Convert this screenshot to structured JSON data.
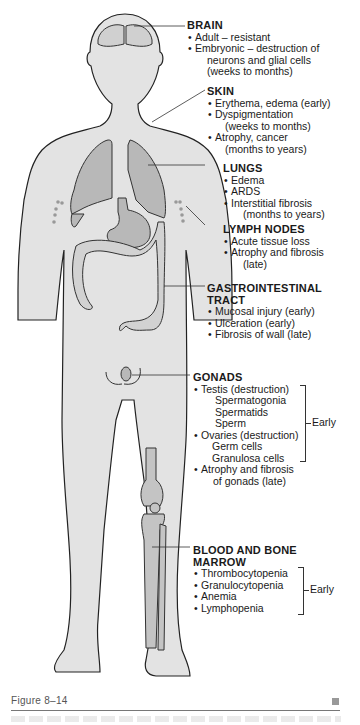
{
  "figure": {
    "caption": "Figure 8–14",
    "colors": {
      "body_fill": "#e3e3e3",
      "organ_fill": "#b8b8b8",
      "outline": "#222222",
      "caption_rule": "#777777"
    }
  },
  "labels": {
    "brain": {
      "title": "BRAIN",
      "items": [
        "Adult – resistant",
        "Embryonic – destruction of"
      ],
      "continuation": [
        "neurons and glial cells",
        "(weeks to months)"
      ]
    },
    "skin": {
      "title": "SKIN",
      "items": [
        "Erythema, edema (early)",
        "Dyspigmentation",
        "Atrophy, cancer"
      ],
      "dyspig_cont": "(weeks to months)",
      "atrophy_cont": "(months to years)"
    },
    "lungs": {
      "title": "LUNGS",
      "items": [
        "Edema",
        "ARDS",
        "Interstitial fibrosis"
      ],
      "fibrosis_cont": "(months to years)"
    },
    "lymph_nodes": {
      "title": "LYMPH NODES",
      "items": [
        "Acute tissue loss",
        "Atrophy and fibrosis"
      ],
      "atrophy_cont": "(late)"
    },
    "gi_tract": {
      "title_line1": "GASTROINTESTINAL",
      "title_line2": "TRACT",
      "items": [
        "Mucosal injury (early)",
        "Ulceration (early)",
        "Fibrosis of wall (late)"
      ]
    },
    "gonads": {
      "title": "GONADS",
      "testis": "Testis (destruction)",
      "testis_sub": [
        "Spermatogonia",
        "Spermatids",
        "Sperm"
      ],
      "ovaries": "Ovaries (destruction)",
      "ovaries_sub": [
        "Germ cells",
        "Granulosa cells"
      ],
      "atrophy": "Atrophy and fibrosis",
      "atrophy_cont": "of gonads (late)",
      "bracket_label": "Early"
    },
    "blood_marrow": {
      "title_line1": "BLOOD AND BONE",
      "title_line2": "MARROW",
      "items": [
        "Thrombocytopenia",
        "Granulocytopenia",
        "Anemia",
        "Lymphopenia"
      ],
      "bracket_label": "Early"
    }
  }
}
